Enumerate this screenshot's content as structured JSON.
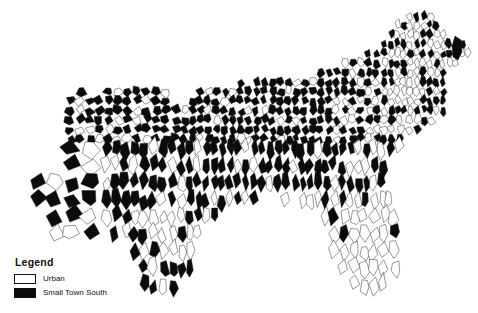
{
  "figure": {
    "type": "choropleth-county-map",
    "region": "United States South",
    "background_color": "#ffffff",
    "border_color": "#1a1a1a"
  },
  "legend": {
    "title": "Legend",
    "items": [
      {
        "label": "Urban",
        "color": "#ffffff",
        "swatch_name": "urban-swatch"
      },
      {
        "label": "Small Town South",
        "color": "#0b0b0b",
        "swatch_name": "small-town-south-swatch"
      }
    ]
  },
  "caption": {
    "text": ""
  },
  "chart_data": {
    "type": "map",
    "title": "",
    "categories": [
      "Urban",
      "Small Town South"
    ],
    "colors": [
      "#ffffff",
      "#0b0b0b"
    ]
  }
}
